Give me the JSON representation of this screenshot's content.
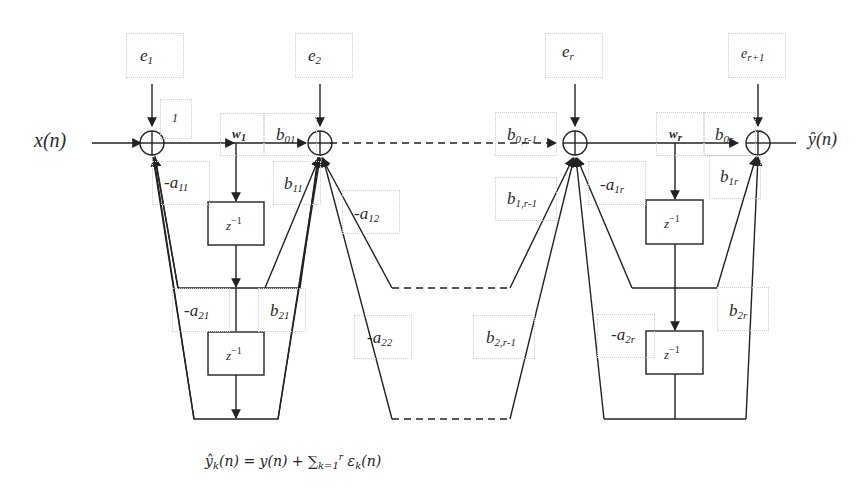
{
  "diagram": {
    "input_label": "x(n)",
    "output_label": "ŷ(n)",
    "error_inputs": [
      {
        "name": "e1",
        "base": "e",
        "sub": "1"
      },
      {
        "name": "e2",
        "base": "e",
        "sub": "2"
      },
      {
        "name": "er",
        "base": "e",
        "sub": "r"
      },
      {
        "name": "er+1",
        "base": "e",
        "sub": "r+1"
      }
    ],
    "gain_first_path": "1",
    "weights": [
      {
        "base": "w",
        "sub": "1"
      },
      {
        "base": "w",
        "sub": "r"
      }
    ],
    "feedforward_coeffs": [
      {
        "base": "b",
        "sub": "01"
      },
      {
        "base": "b",
        "sub": "11"
      },
      {
        "base": "b",
        "sub": "21"
      },
      {
        "base": "b",
        "sub": "0,r-1"
      },
      {
        "base": "b",
        "sub": "1,r-1"
      },
      {
        "base": "b",
        "sub": "2,r-1"
      },
      {
        "base": "b",
        "sub": "0r"
      },
      {
        "base": "b",
        "sub": "1r"
      },
      {
        "base": "b",
        "sub": "2r"
      }
    ],
    "feedback_coeffs": [
      {
        "base": "-a",
        "sub": "11"
      },
      {
        "base": "-a",
        "sub": "21"
      },
      {
        "base": "-a",
        "sub": "12"
      },
      {
        "base": "-a",
        "sub": "22"
      },
      {
        "base": "-a",
        "sub": "1r"
      },
      {
        "base": "-a",
        "sub": "2r"
      }
    ],
    "delay_label": {
      "base": "z",
      "sup": "−1"
    },
    "formula": {
      "lhs": "ŷ",
      "lhs_sub": "k",
      "lhs_arg": "(n) = y(n) + ∑",
      "sum_sub": "k=1",
      "sum_sup": "r",
      "rhs": " ε",
      "rhs_sub": "k",
      "rhs_arg": "(n)"
    }
  }
}
